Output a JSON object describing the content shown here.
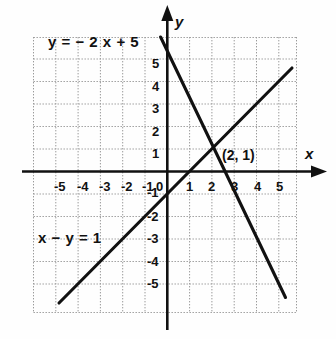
{
  "figure": {
    "title": "",
    "background_color": "#fefefe",
    "ink_color": "#111111",
    "grid_color": "#9a9a9a"
  },
  "axis_names": {
    "x": "x",
    "y": "y"
  },
  "annotations": {
    "equation_1": {
      "text": "y = − 2 x + 5",
      "parts": {
        "lhs": "y",
        "eq": "=",
        "rhs": "− 2 x + 5"
      }
    },
    "equation_2": {
      "text": "x − y = 1",
      "parts": {
        "lhs": "x − y",
        "eq": "=",
        "rhs": "1"
      }
    },
    "intersection_label": "(2, 1)"
  },
  "chart_data": {
    "type": "line",
    "title": "",
    "xlabel": "x",
    "ylabel": "y",
    "xlim": [
      -5.95,
      5.8
    ],
    "ylim": [
      -6.0,
      5.95
    ],
    "grid": true,
    "grid_step": 1,
    "legend": "none",
    "xticks": [
      -5,
      -4,
      -3,
      -2,
      -1,
      0,
      1,
      2,
      3,
      4,
      5
    ],
    "xtick_labels": [
      "-5",
      "-4",
      "-3",
      "-2",
      "-1",
      "0",
      "1",
      "2",
      "3",
      "4",
      "5"
    ],
    "yticks": [
      -5,
      -4,
      -3,
      -2,
      -1,
      1,
      2,
      3,
      4,
      5
    ],
    "ytick_labels": [
      "-5",
      "-4",
      "-3",
      "-2",
      "-1",
      "1",
      "2",
      "3",
      "4",
      "5"
    ],
    "series": [
      {
        "name": "y = − 2 x + 5",
        "type": "line",
        "slope": -2,
        "intercept": 5,
        "x": [
          -0.3,
          5.3
        ],
        "y": [
          5.6,
          -5.6
        ]
      },
      {
        "name": "x − y = 1",
        "type": "line",
        "slope": 1,
        "intercept": -1,
        "x": [
          -4.85,
          5.6
        ],
        "y": [
          -5.85,
          4.6
        ]
      }
    ],
    "annotations": [
      {
        "label": "(2, 1)",
        "x": 2,
        "y": 1,
        "kind": "intersection-point"
      },
      {
        "label": "y = − 2 x + 5",
        "x": -4.3,
        "y": 5.6,
        "kind": "equation"
      },
      {
        "label": "x − y = 1",
        "x": -4.7,
        "y": -2.6,
        "kind": "equation"
      }
    ]
  },
  "tick_positions": {
    "x": [
      {
        "label": "-5",
        "px": 54,
        "py": 180
      },
      {
        "label": "-4",
        "px": 77,
        "py": 180
      },
      {
        "label": "-3",
        "px": 99,
        "py": 180
      },
      {
        "label": "-2",
        "px": 121,
        "py": 180
      },
      {
        "label": "-1",
        "px": 142,
        "py": 180
      },
      {
        "label": "0",
        "px": 156,
        "py": 180
      },
      {
        "label": "1",
        "px": 186,
        "py": 180
      },
      {
        "label": "2",
        "px": 208,
        "py": 180
      },
      {
        "label": "3",
        "px": 231,
        "py": 180
      },
      {
        "label": "4",
        "px": 254,
        "py": 180
      },
      {
        "label": "5",
        "px": 276,
        "py": 180
      }
    ],
    "y": [
      {
        "label": "5",
        "px": 152,
        "py": 57
      },
      {
        "label": "4",
        "px": 152,
        "py": 80
      },
      {
        "label": "3",
        "px": 152,
        "py": 102
      },
      {
        "label": "2",
        "px": 152,
        "py": 125
      },
      {
        "label": "1",
        "px": 152,
        "py": 147
      },
      {
        "label": "-1",
        "px": 147,
        "py": 186
      },
      {
        "label": "-2",
        "px": 147,
        "py": 210
      },
      {
        "label": "-3",
        "px": 147,
        "py": 232
      },
      {
        "label": "-4",
        "px": 147,
        "py": 255
      },
      {
        "label": "-5",
        "px": 147,
        "py": 277
      }
    ]
  }
}
